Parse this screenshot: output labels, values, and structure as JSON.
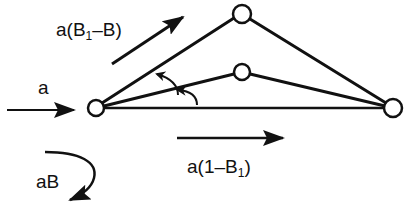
{
  "diagram": {
    "type": "flow-network",
    "stroke_color": "#111111",
    "background": "#ffffff",
    "nodes": [
      {
        "id": "left",
        "x": 96,
        "y": 108,
        "r": 8
      },
      {
        "id": "top",
        "x": 242,
        "y": 14,
        "r": 9
      },
      {
        "id": "middle",
        "x": 242,
        "y": 72,
        "r": 8
      },
      {
        "id": "right",
        "x": 393,
        "y": 108,
        "r": 9
      }
    ],
    "edges": [
      {
        "from": "left",
        "to": "top"
      },
      {
        "from": "top",
        "to": "right"
      },
      {
        "from": "left",
        "to": "middle"
      },
      {
        "from": "middle",
        "to": "right"
      },
      {
        "from": "left",
        "to": "right"
      }
    ],
    "labels": {
      "input": {
        "base": "a",
        "sub": "",
        "tail": ""
      },
      "upper_flow": {
        "base": "a(B",
        "sub": "1",
        "tail": "–B)"
      },
      "lower_flow": {
        "base": "a(1–B",
        "sub": "1",
        "tail": ")"
      },
      "loss": {
        "base": "aB",
        "sub": "",
        "tail": ""
      }
    },
    "arrows": [
      {
        "name": "input-arrow",
        "direction": "right",
        "label": "a"
      },
      {
        "name": "upper-flow-arrow",
        "direction": "up-right",
        "label": "a(B1–B)"
      },
      {
        "name": "lower-flow-arrow",
        "direction": "right",
        "label": "a(1–B1)"
      },
      {
        "name": "loss-arrow",
        "direction": "curved-down-left",
        "label": "aB"
      },
      {
        "name": "angle-arrow-upper",
        "direction": "counterclockwise"
      },
      {
        "name": "angle-arrow-lower",
        "direction": "counterclockwise"
      }
    ]
  }
}
